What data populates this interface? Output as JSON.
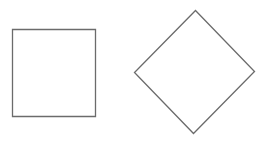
{
  "canvas": {
    "width": 266,
    "height": 147,
    "background": "#ffffff"
  },
  "shapes": [
    {
      "kind": "square",
      "stroke": "#6b6b6b",
      "fill": "#ffffff",
      "points": "12.5,29.5 95.5,29.5 95.5,116.5 12.5,116.5"
    },
    {
      "kind": "diamond",
      "stroke": "#6b6b6b",
      "fill": "#ffffff",
      "points": "195.5,10.5 254.5,71.5 193.5,133.5 134.5,72.5"
    }
  ]
}
